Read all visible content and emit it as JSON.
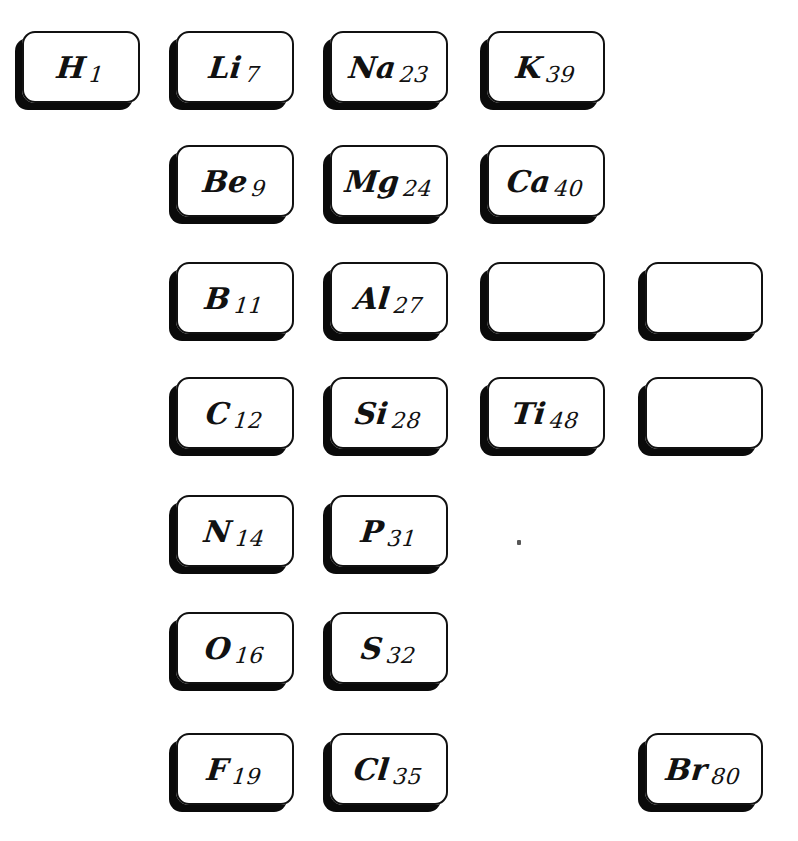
{
  "plate": {
    "title": "Mendeleev element cards plate",
    "background_color": "#ffffff",
    "ink_color": "#111111",
    "shadow_color": "#0a0a0a",
    "width": 798,
    "height": 841
  },
  "card_geometry": {
    "width": 118,
    "height": 72,
    "columns_x": [
      22,
      176,
      330,
      487,
      645
    ],
    "rows_y": [
      31,
      145,
      262,
      377,
      495,
      612,
      733
    ]
  },
  "cards": [
    {
      "id": "card-h",
      "symbol": "H",
      "mass": "1",
      "text": "H 1",
      "row": 0,
      "col": 0,
      "empty": false
    },
    {
      "id": "card-li",
      "symbol": "Li",
      "mass": "7",
      "text": "Li 7",
      "row": 0,
      "col": 1,
      "empty": false
    },
    {
      "id": "card-na",
      "symbol": "Na",
      "mass": "23",
      "text": "Na 23",
      "row": 0,
      "col": 2,
      "empty": false
    },
    {
      "id": "card-k",
      "symbol": "K",
      "mass": "39",
      "text": "K 39",
      "row": 0,
      "col": 3,
      "empty": false
    },
    {
      "id": "card-be",
      "symbol": "Be",
      "mass": "9",
      "text": "Be 9",
      "row": 1,
      "col": 1,
      "empty": false
    },
    {
      "id": "card-mg",
      "symbol": "Mg",
      "mass": "24",
      "text": "Mg 24",
      "row": 1,
      "col": 2,
      "empty": false
    },
    {
      "id": "card-ca",
      "symbol": "Ca",
      "mass": "40",
      "text": "Ca 40",
      "row": 1,
      "col": 3,
      "empty": false
    },
    {
      "id": "card-b",
      "symbol": "B",
      "mass": "11",
      "text": "B 11",
      "row": 2,
      "col": 1,
      "empty": false
    },
    {
      "id": "card-al",
      "symbol": "Al",
      "mass": "27",
      "text": "Al 27",
      "row": 2,
      "col": 2,
      "empty": false
    },
    {
      "id": "card-blank-r3c4",
      "symbol": "",
      "mass": "",
      "text": "",
      "row": 2,
      "col": 3,
      "empty": true
    },
    {
      "id": "card-blank-r3c5",
      "symbol": "",
      "mass": "",
      "text": "",
      "row": 2,
      "col": 4,
      "empty": true
    },
    {
      "id": "card-c",
      "symbol": "C",
      "mass": "12",
      "text": "C 12",
      "row": 3,
      "col": 1,
      "empty": false
    },
    {
      "id": "card-si",
      "symbol": "Si",
      "mass": "28",
      "text": "Si 28",
      "row": 3,
      "col": 2,
      "empty": false
    },
    {
      "id": "card-ti",
      "symbol": "Ti",
      "mass": "48",
      "text": "Ti 48",
      "row": 3,
      "col": 3,
      "empty": false
    },
    {
      "id": "card-blank-r4c5",
      "symbol": "",
      "mass": "",
      "text": "",
      "row": 3,
      "col": 4,
      "empty": true
    },
    {
      "id": "card-n",
      "symbol": "N",
      "mass": "14",
      "text": "N 14",
      "row": 4,
      "col": 1,
      "empty": false
    },
    {
      "id": "card-p",
      "symbol": "P",
      "mass": "31",
      "text": "P 31",
      "row": 4,
      "col": 2,
      "empty": false
    },
    {
      "id": "card-o",
      "symbol": "O",
      "mass": "16",
      "text": "O 16",
      "row": 5,
      "col": 1,
      "empty": false
    },
    {
      "id": "card-s",
      "symbol": "S",
      "mass": "32",
      "text": "S 32",
      "row": 5,
      "col": 2,
      "empty": false
    },
    {
      "id": "card-f",
      "symbol": "F",
      "mass": "19",
      "text": "F 19",
      "row": 6,
      "col": 1,
      "empty": false
    },
    {
      "id": "card-cl",
      "symbol": "Cl",
      "mass": "35",
      "text": "Cl 35",
      "row": 6,
      "col": 2,
      "empty": false
    },
    {
      "id": "card-br",
      "symbol": "Br",
      "mass": "80",
      "text": "Br 80",
      "row": 6,
      "col": 4,
      "empty": false
    }
  ],
  "specks": [
    {
      "id": "speck-1",
      "x": 517,
      "y": 540
    }
  ]
}
